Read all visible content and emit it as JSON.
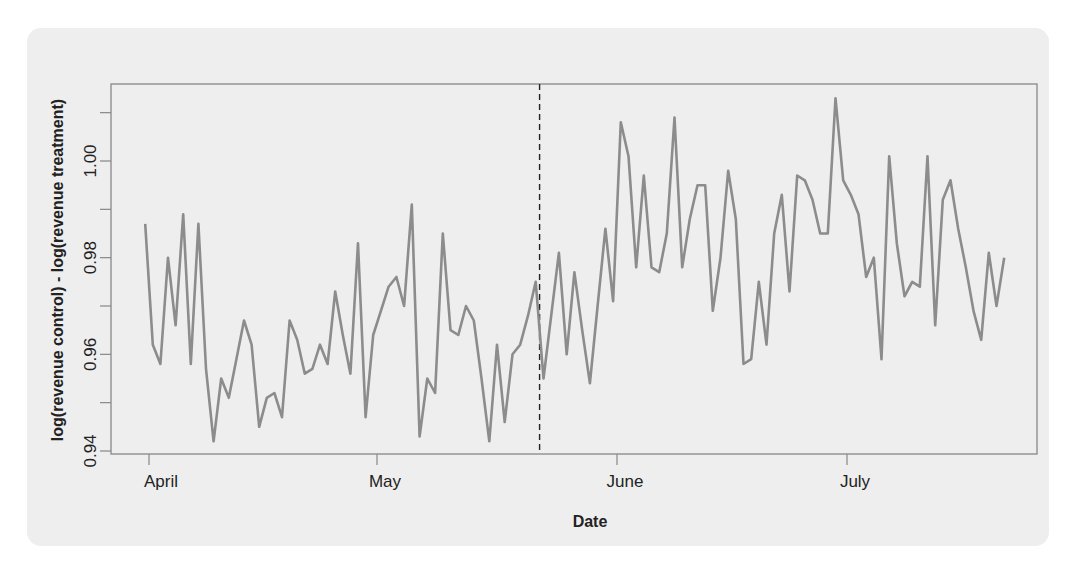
{
  "chart_data": {
    "type": "line",
    "title": "",
    "xlabel": "Date",
    "ylabel": "log(revenue control) - log(revenue treatment)",
    "ylim": [
      0.94,
      1.013
    ],
    "yticks": [
      0.94,
      0.96,
      0.98,
      1.0
    ],
    "ytick_labels": [
      "0.94",
      "0.96",
      "0.98",
      "1.00"
    ],
    "yminor_ticks": [
      0.95,
      0.97,
      0.99,
      1.01
    ],
    "xticks": [
      "April",
      "May",
      "June",
      "July"
    ],
    "x_day_offsets_from_april1": [
      0,
      30,
      61,
      91
    ],
    "grid": false,
    "legend": null,
    "annotations": [
      {
        "type": "vertical-dashed-line",
        "day_offset": 51,
        "description": "intervention start (~May 22)"
      }
    ],
    "line_color": "#8c8c8c",
    "series": [
      {
        "name": "log ratio",
        "start_day_offset": -0.5,
        "step_days": 1,
        "values": [
          0.987,
          0.962,
          0.958,
          0.98,
          0.966,
          0.989,
          0.958,
          0.987,
          0.957,
          0.942,
          0.955,
          0.951,
          0.959,
          0.967,
          0.962,
          0.945,
          0.951,
          0.952,
          0.947,
          0.967,
          0.963,
          0.956,
          0.957,
          0.962,
          0.958,
          0.973,
          0.964,
          0.956,
          0.983,
          0.947,
          0.964,
          0.969,
          0.974,
          0.976,
          0.97,
          0.991,
          0.943,
          0.955,
          0.952,
          0.985,
          0.965,
          0.964,
          0.97,
          0.967,
          0.955,
          0.942,
          0.962,
          0.946,
          0.96,
          0.962,
          0.968,
          0.975,
          0.955,
          0.968,
          0.981,
          0.96,
          0.977,
          0.965,
          0.954,
          0.97,
          0.986,
          0.971,
          1.008,
          1.001,
          0.978,
          0.997,
          0.978,
          0.977,
          0.985,
          1.009,
          0.978,
          0.988,
          0.995,
          0.995,
          0.969,
          0.98,
          0.998,
          0.988,
          0.958,
          0.959,
          0.975,
          0.962,
          0.985,
          0.993,
          0.973,
          0.997,
          0.996,
          0.992,
          0.985,
          0.985,
          1.013,
          0.996,
          0.993,
          0.989,
          0.976,
          0.98,
          0.959,
          1.001,
          0.983,
          0.972,
          0.975,
          0.974,
          1.001,
          0.966,
          0.992,
          0.996,
          0.986,
          0.978,
          0.969,
          0.963,
          0.981,
          0.97,
          0.98
        ]
      }
    ]
  }
}
